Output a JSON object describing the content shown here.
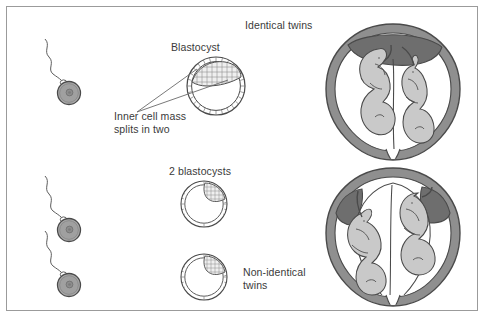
{
  "figure": {
    "width": 485,
    "height": 318,
    "background_color": "#ffffff",
    "border_color": "#9b9b9b"
  },
  "palette": {
    "outline": "#4a4a4a",
    "text": "#3a3a3a",
    "egg_fill": "#a9a9a9",
    "egg_outline": "#5c5c5c",
    "nucleus_fill": "#8d8d8d",
    "uterus_wall": "#8f8f8f",
    "placenta_dark": "#6e6e6e",
    "fetus_fill": "#c9c9c9",
    "membrane": "#ffffff",
    "blastocyst_fill": "#ffffff",
    "blastocyst_cells": "#efefef"
  },
  "labels": {
    "identical_twins": "Identical twins",
    "blastocyst": "Blastocyst",
    "inner_cell_mass": "Inner cell mass\nsplits in two",
    "two_blastocysts": "2 blastocysts",
    "non_identical_twins": "Non-identical\ntwins"
  },
  "top_row": {
    "description": "One sperm fertilises one egg forming one blastocyst whose inner cell mass splits in two, producing identical twins sharing one placenta.",
    "sperm_count": 1,
    "egg_count": 1,
    "blastocyst_count": 1,
    "fetus_count": 2,
    "placenta_count": 1
  },
  "bottom_row": {
    "description": "Two sperm fertilise two eggs forming two blastocysts, producing non-identical twins with separate placentas.",
    "sperm_count": 2,
    "egg_count": 2,
    "blastocyst_count": 2,
    "fetus_count": 2,
    "placenta_count": 2
  }
}
